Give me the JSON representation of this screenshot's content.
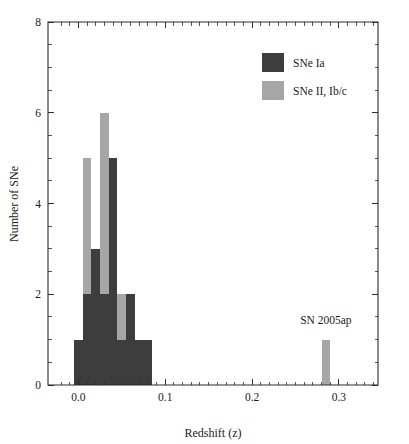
{
  "chart_data": {
    "type": "bar",
    "title": "",
    "subtitle": "",
    "xlabel": "Redshift (z)",
    "ylabel": "Number of SNe",
    "xlim": [
      -0.035,
      0.345
    ],
    "ylim": [
      0,
      8
    ],
    "grid": false,
    "bin_width": 0.01,
    "legend_position": "top-right",
    "x_ticks_major": [
      "0.0",
      "0.1",
      "0.2",
      "0.3"
    ],
    "x_ticks_major_values": [
      0.0,
      0.1,
      0.2,
      0.3
    ],
    "x_ticks_minor_values": [
      -0.02,
      -0.01,
      0.01,
      0.02,
      0.03,
      0.04,
      0.05,
      0.06,
      0.07,
      0.08,
      0.09,
      0.11,
      0.12,
      0.13,
      0.14,
      0.15,
      0.16,
      0.17,
      0.18,
      0.19,
      0.21,
      0.22,
      0.23,
      0.24,
      0.25,
      0.26,
      0.27,
      0.28,
      0.29,
      0.31,
      0.32,
      0.33,
      0.34
    ],
    "y_ticks_major": [
      "0",
      "2",
      "4",
      "6",
      "8"
    ],
    "y_ticks_major_values": [
      0,
      2,
      4,
      6,
      8
    ],
    "y_ticks_minor_values": [
      0.5,
      1,
      1.5,
      2.5,
      3,
      3.5,
      4.5,
      5,
      5.5,
      6.5,
      7,
      7.5
    ],
    "series": [
      {
        "name": "SNe Ia",
        "color": "#3d3d3d",
        "bins": [
          {
            "x0": -0.005,
            "x1": 0.005,
            "value": 1
          },
          {
            "x0": 0.005,
            "x1": 0.015,
            "value": 2
          },
          {
            "x0": 0.015,
            "x1": 0.025,
            "value": 3
          },
          {
            "x0": 0.025,
            "x1": 0.035,
            "value": 2
          },
          {
            "x0": 0.035,
            "x1": 0.045,
            "value": 5
          },
          {
            "x0": 0.045,
            "x1": 0.055,
            "value": 1
          },
          {
            "x0": 0.055,
            "x1": 0.065,
            "value": 2
          },
          {
            "x0": 0.065,
            "x1": 0.075,
            "value": 1
          },
          {
            "x0": 0.075,
            "x1": 0.085,
            "value": 1
          }
        ]
      },
      {
        "name": "SNe II, Ib/c",
        "color": "#a6a6a6",
        "bins": [
          {
            "x0": -0.005,
            "x1": 0.005,
            "value": 1
          },
          {
            "x0": 0.005,
            "x1": 0.015,
            "value": 5
          },
          {
            "x0": 0.015,
            "x1": 0.025,
            "value": 3
          },
          {
            "x0": 0.025,
            "x1": 0.035,
            "value": 6
          },
          {
            "x0": 0.035,
            "x1": 0.045,
            "value": 4
          },
          {
            "x0": 0.045,
            "x1": 0.055,
            "value": 2
          },
          {
            "x0": 0.28,
            "x1": 0.29,
            "value": 1
          }
        ]
      }
    ],
    "annotations": [
      {
        "text": "SN 2005ap",
        "x": 0.285,
        "y": 1.35,
        "anchor": "middle"
      }
    ],
    "legend": [
      {
        "label": "SNe Ia",
        "color": "#3d3d3d"
      },
      {
        "label": "SNe II, Ib/c",
        "color": "#a6a6a6"
      }
    ]
  }
}
